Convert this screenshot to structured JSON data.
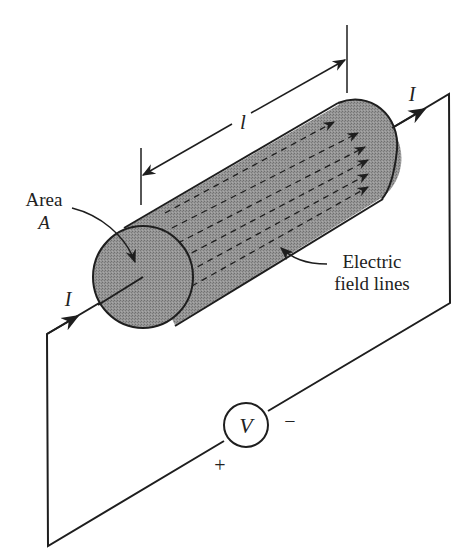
{
  "figure": {
    "colors": {
      "ink": "#1e1e1e",
      "conductor_fill": "#8f8f8f",
      "background": "#ffffff"
    },
    "labels": {
      "area_line1": "Area",
      "area_line2": "A",
      "length": "l",
      "current_in": "I",
      "current_out": "I",
      "field_line1": "Electric",
      "field_line2": "field lines",
      "source": "V",
      "plus": "+",
      "minus": "−"
    },
    "components": [
      {
        "name": "cylindrical-conductor",
        "type": "cylinder"
      },
      {
        "name": "voltage-source",
        "type": "circle-source",
        "label": "V"
      },
      {
        "name": "circuit-wire",
        "type": "wire-loop"
      },
      {
        "name": "length-dimension",
        "type": "dimension-arrow",
        "label": "l"
      },
      {
        "name": "electric-field-arrows",
        "type": "arrow-array",
        "count_rows": 6
      }
    ]
  }
}
